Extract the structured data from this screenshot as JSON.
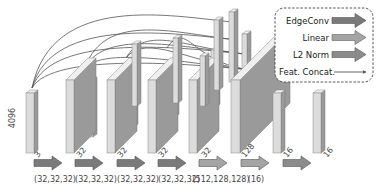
{
  "figure": {
    "input_dim_label": "4096",
    "blocks": [
      {
        "id": "input",
        "channels_label": "3"
      },
      {
        "id": "edgeconv1",
        "channels_label": "32"
      },
      {
        "id": "edgeconv2",
        "channels_label": "32"
      },
      {
        "id": "edgeconv3",
        "channels_label": "32"
      },
      {
        "id": "edgeconv4",
        "channels_label": "32"
      },
      {
        "id": "concat",
        "channels_label": "128"
      },
      {
        "id": "linear",
        "channels_label": "16"
      },
      {
        "id": "l2norm",
        "channels_label": "16"
      }
    ],
    "operations": [
      {
        "type": "EdgeConv",
        "label": "(32,32,32)"
      },
      {
        "type": "EdgeConv",
        "label": "(32,32,32)"
      },
      {
        "type": "EdgeConv",
        "label": "(32,32,32)"
      },
      {
        "type": "EdgeConv",
        "label": "(32,32,32)"
      },
      {
        "type": "Linear",
        "label": "(512,128,128)"
      },
      {
        "type": "Linear",
        "label": "(16)"
      },
      {
        "type": "L2 Norm",
        "label": ""
      }
    ],
    "legend": {
      "items": [
        {
          "label": "EdgeConv",
          "kind": "arrow",
          "color": "#7a7a7a"
        },
        {
          "label": "Linear",
          "kind": "arrow",
          "color": "#a4a4a4"
        },
        {
          "label": "L2 Norm",
          "kind": "arrow",
          "color": "#8c8c8c"
        },
        {
          "label": "Feat. Concat.",
          "kind": "line",
          "color": "#555555"
        }
      ]
    },
    "colors": {
      "block_front": "#dcdcdc",
      "block_side": "#9a9a9a",
      "block_top": "#efefef",
      "edgeconv_arrow": "#7a7a7a",
      "linear_arrow": "#a4a4a4",
      "l2_arrow": "#8c8c8c"
    }
  }
}
